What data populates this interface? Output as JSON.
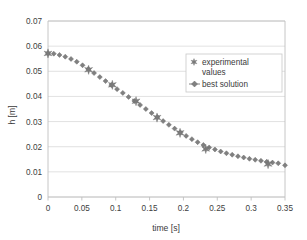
{
  "chart_data": {
    "type": "scatter",
    "title": "",
    "xlabel": "time [s]",
    "ylabel": "h [m]",
    "xlim": [
      0,
      0.35
    ],
    "ylim": [
      0,
      0.07
    ],
    "xticks": [
      "0",
      "0.05",
      "0.1",
      "0.15",
      "0.2",
      "0.25",
      "0.3",
      "0.35"
    ],
    "xtick_values": [
      0,
      0.05,
      0.1,
      0.15,
      0.2,
      0.25,
      0.3,
      0.35
    ],
    "yticks": [
      "0",
      "0.01",
      "0.02",
      "0.03",
      "0.04",
      "0.05",
      "0.06",
      "0.07"
    ],
    "ytick_values": [
      0,
      0.01,
      0.02,
      0.03,
      0.04,
      0.05,
      0.06,
      0.07
    ],
    "grid": "horizontal",
    "legend_position": "upper-right-inside",
    "series": [
      {
        "name": "experimental values",
        "marker": "star",
        "color": "#7a7a7a",
        "x": [
          0.0,
          0.06,
          0.095,
          0.13,
          0.161,
          0.195,
          0.233,
          0.325
        ],
        "y": [
          0.0571,
          0.0506,
          0.0446,
          0.0381,
          0.0316,
          0.0255,
          0.0191,
          0.0131
        ]
      },
      {
        "name": "best solution",
        "marker": "diamond",
        "color": "#808080",
        "x": [
          0.0,
          0.0085,
          0.017,
          0.0255,
          0.034,
          0.0425,
          0.051,
          0.0595,
          0.068,
          0.0765,
          0.085,
          0.0935,
          0.102,
          0.1105,
          0.119,
          0.1275,
          0.136,
          0.1445,
          0.153,
          0.1615,
          0.17,
          0.1785,
          0.187,
          0.1955,
          0.204,
          0.2125,
          0.221,
          0.2295,
          0.238,
          0.2465,
          0.255,
          0.2635,
          0.272,
          0.2805,
          0.289,
          0.2975,
          0.306,
          0.3145,
          0.323,
          0.3315,
          0.34,
          0.35
        ],
        "y": [
          0.0572,
          0.057,
          0.0565,
          0.0558,
          0.0549,
          0.0538,
          0.0524,
          0.0509,
          0.0493,
          0.0477,
          0.0461,
          0.0445,
          0.0429,
          0.0414,
          0.0398,
          0.0382,
          0.0366,
          0.035,
          0.0334,
          0.0318,
          0.0302,
          0.0287,
          0.0272,
          0.0257,
          0.0243,
          0.023,
          0.0218,
          0.0207,
          0.0197,
          0.0189,
          0.0181,
          0.0174,
          0.0168,
          0.0162,
          0.0157,
          0.0152,
          0.0148,
          0.0144,
          0.014,
          0.0137,
          0.0134,
          0.0126
        ]
      }
    ]
  },
  "legend": {
    "entries": [
      {
        "label_line1": "experimental",
        "label_line2": "values",
        "marker": "star"
      },
      {
        "label_line1": "best solution",
        "label_line2": "",
        "marker": "diamond"
      }
    ]
  },
  "colors": {
    "marker": "#808080",
    "grid": "#d9d9d9",
    "axis": "#bfbfbf",
    "text": "#3a3a3a",
    "background": "#ffffff"
  }
}
